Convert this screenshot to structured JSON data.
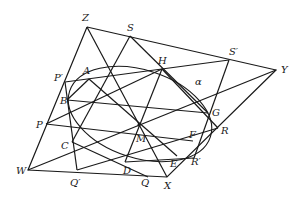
{
  "figure": {
    "ellipse_label": "α",
    "points": {
      "Z": {
        "label": "Z",
        "x": 87,
        "y": 27,
        "lx": 82,
        "ly": 21
      },
      "S": {
        "label": "S",
        "x": 130,
        "y": 36,
        "lx": 127,
        "ly": 31
      },
      "S2": {
        "label": "S′",
        "x": 229,
        "y": 60,
        "lx": 229,
        "ly": 55
      },
      "Y": {
        "label": "Y",
        "x": 276,
        "y": 70,
        "lx": 281,
        "ly": 73
      },
      "P2": {
        "label": "P′",
        "x": 65,
        "y": 82,
        "lx": 54,
        "ly": 81
      },
      "A": {
        "label": "A",
        "x": 89,
        "y": 79,
        "lx": 83,
        "ly": 74
      },
      "H": {
        "label": "H",
        "x": 162,
        "y": 69,
        "lx": 158,
        "ly": 64
      },
      "B": {
        "label": "B",
        "x": 67,
        "y": 100,
        "lx": 60,
        "ly": 104
      },
      "P": {
        "label": "P",
        "x": 46,
        "y": 124,
        "lx": 36,
        "ly": 128
      },
      "C": {
        "label": "C",
        "x": 72,
        "y": 142,
        "lx": 61,
        "ly": 149
      },
      "M": {
        "label": "M",
        "x": 139,
        "y": 125,
        "lx": 136,
        "ly": 142
      },
      "G": {
        "label": "G",
        "x": 208,
        "y": 113,
        "lx": 212,
        "ly": 116
      },
      "R": {
        "label": "R",
        "x": 218,
        "y": 128,
        "lx": 221,
        "ly": 134
      },
      "F": {
        "label": "F",
        "x": 193,
        "y": 141,
        "lx": 189,
        "ly": 138
      },
      "R2": {
        "label": "R′",
        "x": 194,
        "y": 158,
        "lx": 191,
        "ly": 165
      },
      "E": {
        "label": "E",
        "x": 177,
        "y": 156,
        "lx": 170,
        "ly": 167
      },
      "D": {
        "label": "D",
        "x": 125,
        "y": 162,
        "lx": 123,
        "ly": 174
      },
      "W": {
        "label": "W",
        "x": 28,
        "y": 170,
        "lx": 16,
        "ly": 174
      },
      "Q2": {
        "label": "Q′",
        "x": 77,
        "y": 170,
        "lx": 70,
        "ly": 186
      },
      "Q": {
        "label": "Q",
        "x": 148,
        "y": 177,
        "lx": 141,
        "ly": 186
      },
      "X": {
        "label": "X",
        "x": 167,
        "y": 177,
        "lx": 164,
        "ly": 189
      }
    },
    "ellipse": {
      "cx": 140,
      "cy": 113,
      "rx": 76,
      "ry": 46,
      "rotate": 18
    }
  }
}
